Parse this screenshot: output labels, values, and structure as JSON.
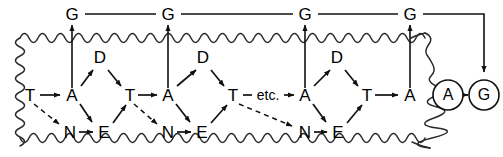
{
  "diagram": {
    "type": "cyclic-pathway",
    "boundary": {
      "name": "wavy-membrane",
      "style": "sinusoidal-closed-loop",
      "color": "#1a1a1a"
    },
    "top_nodes": [
      {
        "id": "g1",
        "label": "G",
        "x": 72,
        "y": 14
      },
      {
        "id": "g2",
        "label": "G",
        "x": 168,
        "y": 14
      },
      {
        "id": "g3",
        "label": "G",
        "x": 305,
        "y": 14
      },
      {
        "id": "g4",
        "label": "G",
        "x": 410,
        "y": 14
      }
    ],
    "d_nodes": [
      {
        "id": "d1",
        "label": "D",
        "x": 100,
        "y": 57
      },
      {
        "id": "d2",
        "label": "D",
        "x": 203,
        "y": 57
      },
      {
        "id": "d3",
        "label": "D",
        "x": 337,
        "y": 57
      }
    ],
    "main_row": [
      {
        "id": "t0",
        "label": "T",
        "x": 30,
        "y": 95
      },
      {
        "id": "a1",
        "label": "A",
        "x": 72,
        "y": 95
      },
      {
        "id": "t1",
        "label": "T",
        "x": 130,
        "y": 95
      },
      {
        "id": "a2",
        "label": "A",
        "x": 168,
        "y": 95
      },
      {
        "id": "t2",
        "label": "T",
        "x": 233,
        "y": 95
      },
      {
        "id": "etc",
        "label": "etc.",
        "x": 268,
        "y": 95
      },
      {
        "id": "a3",
        "label": "A",
        "x": 305,
        "y": 95
      },
      {
        "id": "t3",
        "label": "T",
        "x": 367,
        "y": 95
      },
      {
        "id": "a4",
        "label": "A",
        "x": 410,
        "y": 95
      }
    ],
    "bottom_row": [
      {
        "id": "n1",
        "label": "N",
        "x": 70,
        "y": 132
      },
      {
        "id": "e1",
        "label": "E",
        "x": 104,
        "y": 132
      },
      {
        "id": "n2",
        "label": "N",
        "x": 168,
        "y": 132
      },
      {
        "id": "e2",
        "label": "E",
        "x": 202,
        "y": 132
      },
      {
        "id": "n3",
        "label": "N",
        "x": 305,
        "y": 132
      },
      {
        "id": "e3",
        "label": "E",
        "x": 338,
        "y": 132
      }
    ],
    "circled_nodes": [
      {
        "id": "ca",
        "label": "A",
        "x": 448,
        "y": 95,
        "r": 15
      },
      {
        "id": "cg",
        "label": "G",
        "x": 484,
        "y": 95,
        "r": 15
      }
    ],
    "edges": {
      "solid_count": 27,
      "dashed_count": 3,
      "dashed_description": "T to N inhibitory/alternate routes",
      "vertical_description": "A to G transport arrows crossing the membrane",
      "top_line_description": "horizontal line linking all G nodes, turning down to circled G"
    }
  }
}
